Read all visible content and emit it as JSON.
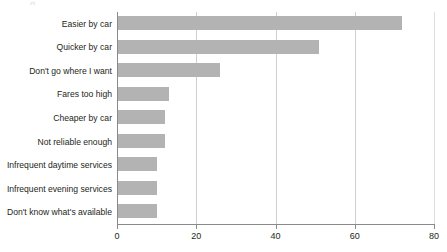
{
  "chart_data": {
    "type": "bar",
    "orientation": "horizontal",
    "title": "",
    "xlabel": "",
    "ylabel": "",
    "categories": [
      "Easier by car",
      "Quicker by car",
      "Don't go where I want",
      "Fares too high",
      "Cheaper by car",
      "Not reliable enough",
      "Infrequent daytime services",
      "Infrequent evening services",
      "Don't know what's available"
    ],
    "values": [
      72,
      51,
      26,
      13,
      12,
      12,
      10,
      10,
      10
    ],
    "xlim": [
      0,
      80
    ],
    "xticks": [
      0,
      20,
      40,
      60,
      80
    ],
    "xtick_labels": [
      "0",
      "20",
      "40",
      "60",
      "80"
    ],
    "gridlines": "vertical",
    "legend": "none",
    "bar_color": "#b3b3b3",
    "axis_color": "#8a8a8a",
    "gridline_color": "#cfcfcf",
    "text_color": "#231f20"
  },
  "artifact": {
    "clipped_text": "g"
  }
}
